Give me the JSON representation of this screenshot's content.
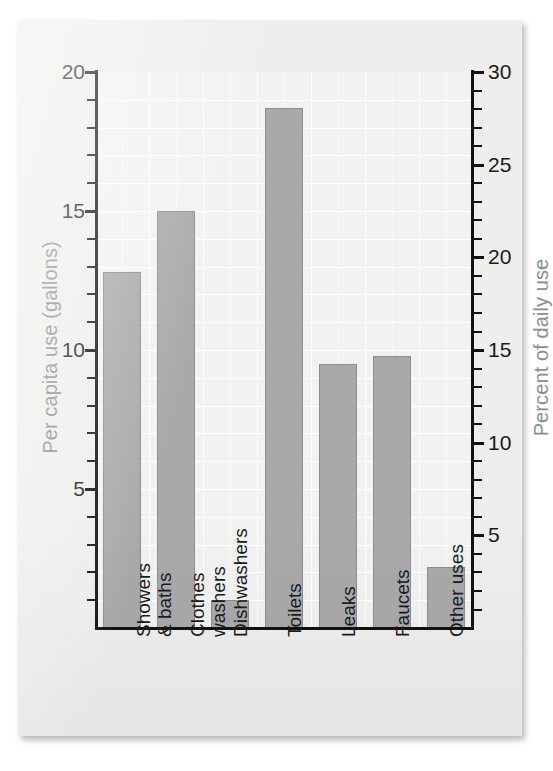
{
  "chart_data": {
    "type": "bar",
    "title": "",
    "categories": [
      "Showers\n& baths",
      "Clothes\nwashers",
      "Dishwashers",
      "Toilets",
      "Leaks",
      "Faucets",
      "Other uses"
    ],
    "values": [
      12.8,
      15.0,
      1.0,
      18.7,
      9.5,
      9.8,
      2.2
    ],
    "series": [
      {
        "name": "Per capita use (gallons)",
        "values": [
          12.8,
          15.0,
          1.0,
          18.7,
          9.5,
          9.8,
          2.2
        ]
      },
      {
        "name": "Percent of daily use",
        "values": [
          19.2,
          22.5,
          1.5,
          28.1,
          14.3,
          14.7,
          3.3
        ]
      }
    ],
    "xlabel": "",
    "ylabel": "Per capita use (gallons)",
    "y2label": "Percent of daily use",
    "ylim": [
      0,
      20
    ],
    "y2lim": [
      0,
      30
    ],
    "yticks": [
      5,
      10,
      15,
      20
    ],
    "ytick_labels": [
      "5",
      "10",
      "15",
      "20"
    ],
    "y2ticks": [
      5,
      10,
      15,
      20,
      25,
      30
    ],
    "y2tick_labels": [
      "5",
      "10",
      "15",
      "20",
      "25",
      "30"
    ],
    "y_minor_step": 1,
    "y2_minor_step": 1,
    "grid": true,
    "legend": "none",
    "bar_color": "#a9a9a9",
    "bar_edge_color": "#8e8e8e",
    "axis_label_color": "#8d8d8d",
    "grid_color": "#ffffff",
    "plot_background": "#f2f2f0",
    "card_background": "#eeeeec"
  },
  "axes": {
    "left_title": "Per capita use (gallons)",
    "right_title": "Percent of daily use",
    "left_ticks": [
      "20",
      "15",
      "10",
      "5"
    ],
    "right_ticks": [
      "30",
      "25",
      "20",
      "15",
      "10",
      "5"
    ]
  },
  "categories": [
    {
      "line1": "Showers",
      "line2": "& baths"
    },
    {
      "line1": "Clothes",
      "line2": "washers"
    },
    {
      "line1": "Dishwashers",
      "line2": ""
    },
    {
      "line1": "Toilets",
      "line2": ""
    },
    {
      "line1": "Leaks",
      "line2": ""
    },
    {
      "line1": "Faucets",
      "line2": ""
    },
    {
      "line1": "Other uses",
      "line2": ""
    }
  ]
}
